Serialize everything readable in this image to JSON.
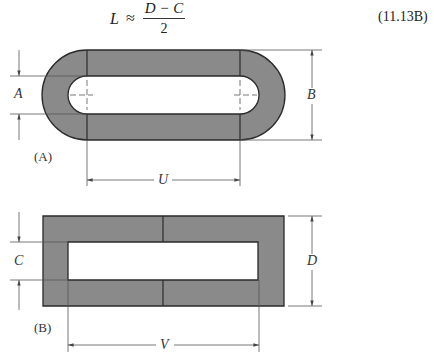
{
  "equation": {
    "lhs": "L",
    "relation": "≈",
    "numerator": "D − C",
    "denominator": "2",
    "number": "(11.13B)"
  },
  "figure_a": {
    "label": "(A)",
    "shape": "oval / racetrack ring (rounded ends)",
    "dimensions": {
      "inner_width": "A",
      "outer_height": "B",
      "center_distance": "U"
    }
  },
  "figure_b": {
    "label": "(B)",
    "shape": "rectangular frame",
    "dimensions": {
      "inner_height": "C",
      "outer_height": "D",
      "inner_length": "V"
    }
  },
  "colors": {
    "fill": "#8a8a8a",
    "outline": "#2a2a2a",
    "dim_line": "#555555",
    "background": "#ffffff"
  }
}
